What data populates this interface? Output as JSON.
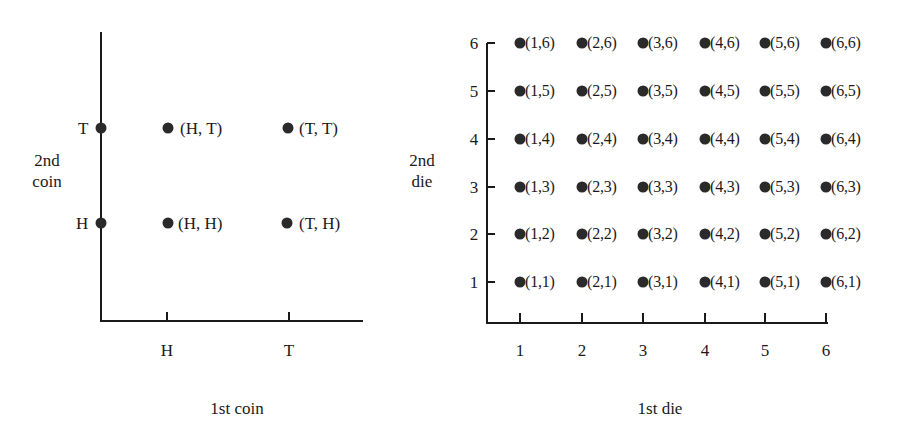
{
  "chart_data": [
    {
      "type": "scatter",
      "title": "Sample space: two coin tosses",
      "xlabel": "1st coin",
      "ylabel_lines": [
        "2nd",
        "coin"
      ],
      "x_ticks": [
        "H",
        "T"
      ],
      "y_ticks": [
        "H",
        "T"
      ],
      "points": [
        {
          "x": "H",
          "y": "T",
          "label": "(H, T)"
        },
        {
          "x": "T",
          "y": "T",
          "label": "(T, T)"
        },
        {
          "x": "H",
          "y": "H",
          "label": "(H, H)"
        },
        {
          "x": "T",
          "y": "H",
          "label": "(T, H)"
        }
      ],
      "axis_points": [
        {
          "y": "T"
        },
        {
          "y": "H"
        }
      ],
      "grid": false
    },
    {
      "type": "scatter",
      "title": "Sample space: two dice rolls",
      "xlabel": "1st die",
      "ylabel_lines": [
        "2nd",
        "die"
      ],
      "x_ticks": [
        "1",
        "2",
        "3",
        "4",
        "5",
        "6"
      ],
      "y_ticks": [
        "1",
        "2",
        "3",
        "4",
        "5",
        "6"
      ],
      "xlim": [
        1,
        6
      ],
      "ylim": [
        1,
        6
      ],
      "points": [
        {
          "x": 1,
          "y": 6,
          "label": "(1,6)"
        },
        {
          "x": 2,
          "y": 6,
          "label": "(2,6)"
        },
        {
          "x": 3,
          "y": 6,
          "label": "(3,6)"
        },
        {
          "x": 4,
          "y": 6,
          "label": "(4,6)"
        },
        {
          "x": 5,
          "y": 6,
          "label": "(5,6)"
        },
        {
          "x": 6,
          "y": 6,
          "label": "(6,6)"
        },
        {
          "x": 1,
          "y": 5,
          "label": "(1,5)"
        },
        {
          "x": 2,
          "y": 5,
          "label": "(2,5)"
        },
        {
          "x": 3,
          "y": 5,
          "label": "(3,5)"
        },
        {
          "x": 4,
          "y": 5,
          "label": "(4,5)"
        },
        {
          "x": 5,
          "y": 5,
          "label": "(5,5)"
        },
        {
          "x": 6,
          "y": 5,
          "label": "(6,5)"
        },
        {
          "x": 1,
          "y": 4,
          "label": "(1,4)"
        },
        {
          "x": 2,
          "y": 4,
          "label": "(2,4)"
        },
        {
          "x": 3,
          "y": 4,
          "label": "(3,4)"
        },
        {
          "x": 4,
          "y": 4,
          "label": "(4,4)"
        },
        {
          "x": 5,
          "y": 4,
          "label": "(5,4)"
        },
        {
          "x": 6,
          "y": 4,
          "label": "(6,4)"
        },
        {
          "x": 1,
          "y": 3,
          "label": "(1,3)"
        },
        {
          "x": 2,
          "y": 3,
          "label": "(2,3)"
        },
        {
          "x": 3,
          "y": 3,
          "label": "(3,3)"
        },
        {
          "x": 4,
          "y": 3,
          "label": "(4,3)"
        },
        {
          "x": 5,
          "y": 3,
          "label": "(5,3)"
        },
        {
          "x": 6,
          "y": 3,
          "label": "(6,3)"
        },
        {
          "x": 1,
          "y": 2,
          "label": "(1,2)"
        },
        {
          "x": 2,
          "y": 2,
          "label": "(2,2)"
        },
        {
          "x": 3,
          "y": 2,
          "label": "(3,2)"
        },
        {
          "x": 4,
          "y": 2,
          "label": "(4,2)"
        },
        {
          "x": 5,
          "y": 2,
          "label": "(5,2)"
        },
        {
          "x": 6,
          "y": 2,
          "label": "(6,2)"
        },
        {
          "x": 1,
          "y": 1,
          "label": "(1,1)"
        },
        {
          "x": 2,
          "y": 1,
          "label": "(2,1)"
        },
        {
          "x": 3,
          "y": 1,
          "label": "(3,1)"
        },
        {
          "x": 4,
          "y": 1,
          "label": "(4,1)"
        },
        {
          "x": 5,
          "y": 1,
          "label": "(5,1)"
        },
        {
          "x": 6,
          "y": 1,
          "label": "(6,1)"
        }
      ],
      "grid": false
    }
  ],
  "coin": {
    "ylabel_line1": "2nd",
    "ylabel_line2": "coin",
    "xlabel": "1st coin",
    "x_ticks": [
      "H",
      "T"
    ],
    "y_ticks": {
      "top": "T",
      "bottom": "H"
    },
    "points": {
      "HT": "(H, T)",
      "TT": "(T, T)",
      "HH": "(H, H)",
      "TH": "(T, H)"
    }
  },
  "dice": {
    "ylabel_line1": "2nd",
    "ylabel_line2": "die",
    "xlabel": "1st die",
    "ticks": [
      "1",
      "2",
      "3",
      "4",
      "5",
      "6"
    ]
  }
}
